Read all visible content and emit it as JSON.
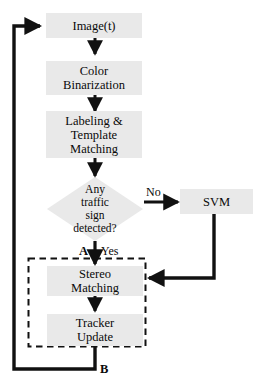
{
  "diagram": {
    "type": "flowchart",
    "colors": {
      "node_fill": "#e9e9e9",
      "stroke": "#111111",
      "background": "#ffffff",
      "text": "#0a0a0a"
    },
    "nodes": [
      {
        "id": "image",
        "shape": "rect",
        "lines": [
          "Image(t)"
        ]
      },
      {
        "id": "color_binarization",
        "shape": "rect",
        "lines": [
          "Color",
          "Binarization"
        ]
      },
      {
        "id": "labeling_template",
        "shape": "rect",
        "lines": [
          "Labeling &",
          "Template",
          "Matching"
        ]
      },
      {
        "id": "decision",
        "shape": "diamond",
        "lines": [
          "Any",
          "traffic",
          "sign",
          "detected?"
        ]
      },
      {
        "id": "svm",
        "shape": "rect",
        "lines": [
          "SVM"
        ]
      },
      {
        "id": "stereo_matching",
        "shape": "rect",
        "lines": [
          "Stereo",
          "Matching"
        ]
      },
      {
        "id": "tracker_update",
        "shape": "rect",
        "lines": [
          "Tracker",
          "Update"
        ]
      }
    ],
    "edge_labels": {
      "no": "No",
      "yes": "Yes",
      "connector_a": "A",
      "connector_b": "B"
    },
    "groups": [
      {
        "id": "tracking_group",
        "style": "dashed",
        "contains": [
          "stereo_matching",
          "tracker_update"
        ]
      }
    ]
  }
}
